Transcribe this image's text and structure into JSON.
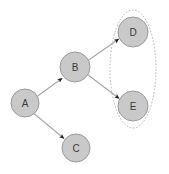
{
  "diagram": {
    "type": "directed-graph",
    "background_color": "#ffffff",
    "width": 169,
    "height": 174,
    "node_fill_color": "#c9c9c9",
    "node_stroke_color": "#9b9b9b",
    "edge_color": "#a6a6a6",
    "arrowhead_color": "#1f1f1f",
    "group_stroke_color": "#b0b0b0",
    "nodes": [
      {
        "id": "A",
        "label": "A",
        "cx": 25,
        "cy": 103,
        "r": 14
      },
      {
        "id": "B",
        "label": "B",
        "cx": 75,
        "cy": 67,
        "r": 15
      },
      {
        "id": "C",
        "label": "C",
        "cx": 76,
        "cy": 148,
        "r": 14
      },
      {
        "id": "D",
        "label": "D",
        "cx": 133,
        "cy": 32,
        "r": 15
      },
      {
        "id": "E",
        "label": "E",
        "cx": 133,
        "cy": 106,
        "r": 15
      }
    ],
    "edges": [
      {
        "id": "A-B",
        "from": "A",
        "to": "B",
        "directed": true
      },
      {
        "id": "A-C",
        "from": "A",
        "to": "C",
        "directed": true
      },
      {
        "id": "B-D",
        "from": "B",
        "to": "D",
        "directed": true
      },
      {
        "id": "B-E",
        "from": "B",
        "to": "E",
        "directed": true
      }
    ],
    "groups": [
      {
        "id": "group-DE",
        "label": "",
        "members": [
          "D",
          "E"
        ],
        "shape": "ellipse",
        "cx": 133,
        "cy": 69,
        "rx": 23,
        "ry": 59,
        "style": "dotted"
      }
    ]
  }
}
